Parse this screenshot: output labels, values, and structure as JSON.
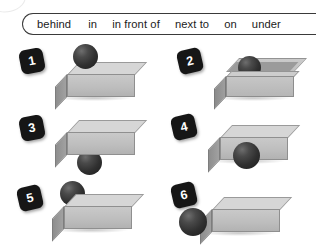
{
  "wordbank": {
    "name": "preposition-word-bank",
    "words": [
      "behind",
      "in",
      "in front of",
      "next to",
      "on",
      "under"
    ]
  },
  "items": [
    {
      "number": "1",
      "relation": "on",
      "object": "ball",
      "reference": "box"
    },
    {
      "number": "2",
      "relation": "in",
      "object": "ball",
      "reference": "open box"
    },
    {
      "number": "3",
      "relation": "under",
      "object": "ball",
      "reference": "box"
    },
    {
      "number": "4",
      "relation": "in front of",
      "object": "ball",
      "reference": "box"
    },
    {
      "number": "5",
      "relation": "behind",
      "object": "ball",
      "reference": "box"
    },
    {
      "number": "6",
      "relation": "next to",
      "object": "ball",
      "reference": "box"
    }
  ],
  "colors": {
    "ball": "#2b2b2b",
    "box_top": "#d6d6d6",
    "box_front": "#bdbdbd",
    "box_side": "#959595",
    "badge_bg": "#161616",
    "badge_text": "#ffffff",
    "bar_border": "#3a3a3a",
    "page_bg": "#ffffff"
  }
}
